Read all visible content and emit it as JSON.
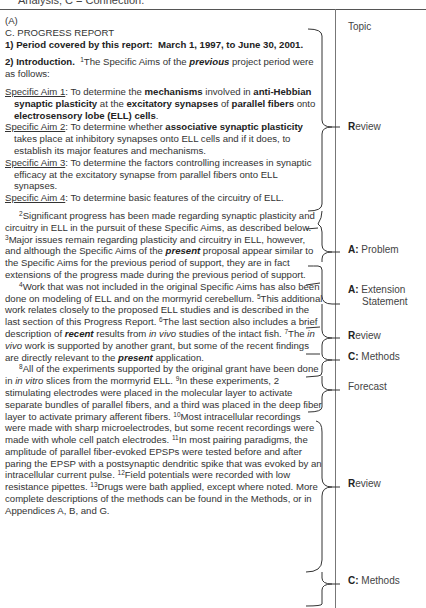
{
  "top_cut_text": "Analysis; C = Connection.",
  "document": {
    "label": "(A)",
    "section_title": "C. PROGRESS REPORT",
    "period": {
      "prefix": "1) Period covered by this report:",
      "value": "March 1, 1997, to June 30, 2001."
    },
    "intro": {
      "heading": "2) Introduction.",
      "s1_num": "1",
      "s1_a": "The Specific Aims of the ",
      "s1_em": "previous",
      "s1_b": " project period were as follows:"
    },
    "aims": [
      {
        "label": "Specific Aim 1",
        "parts": [
          {
            "t": ":  To determine the ",
            "s": ""
          },
          {
            "t": "mechanisms",
            "s": "b"
          },
          {
            "t": " involved in ",
            "s": ""
          },
          {
            "t": "anti-Hebbian synaptic plasticity",
            "s": "b"
          },
          {
            "t": " at the ",
            "s": ""
          },
          {
            "t": "excitatory synapses",
            "s": "b"
          },
          {
            "t": " of ",
            "s": ""
          },
          {
            "t": "parallel fibers",
            "s": "b"
          },
          {
            "t": " onto ",
            "s": ""
          },
          {
            "t": "electrosensory lobe (ELL) cells",
            "s": "b"
          },
          {
            "t": ".",
            "s": ""
          }
        ]
      },
      {
        "label": "Specific Aim 2",
        "parts": [
          {
            "t": ":  To determine whether ",
            "s": ""
          },
          {
            "t": "associative synaptic plasticity",
            "s": "b"
          },
          {
            "t": " takes place at inhibitory synapses onto ELL cells and if it does, to establish its major features and mechanisms.",
            "s": ""
          }
        ]
      },
      {
        "label": "Specific Aim 3",
        "parts": [
          {
            "t": ":  To determine the factors controlling increases in synaptic efficacy at the excitatory synapse from parallel fibers onto ELL synapses.",
            "s": ""
          }
        ]
      },
      {
        "label": "Specific Aim 4",
        "parts": [
          {
            "t": ":  To determine basic features of the circuitry of ELL.",
            "s": ""
          }
        ]
      }
    ],
    "paragraphs": [
      [
        {
          "t": "2",
          "s": "sup"
        },
        {
          "t": "Significant progress has been made regarding synaptic plasticity and circuitry in ELL in the pursuit of these Specific Aims, as described below.  ",
          "s": ""
        },
        {
          "t": "3",
          "s": "sup"
        },
        {
          "t": "Major issues remain regarding plasticity and circuitry in ELL, however, and although the Specific Aims of the ",
          "s": ""
        },
        {
          "t": "present",
          "s": "bi"
        },
        {
          "t": " proposal appear similar to the Specific Aims for the previous period of support, they are in fact extensions of the progress made during the previous period of support.",
          "s": ""
        }
      ],
      [
        {
          "t": "4",
          "s": "sup"
        },
        {
          "t": "Work that was not included in the original Specific Aims has also been done on modeling of ELL and on the mormyrid cerebellum.  ",
          "s": ""
        },
        {
          "t": "5",
          "s": "sup"
        },
        {
          "t": "This additional work relates closely to the proposed ELL studies and is described in the last section of this Progress Report.  ",
          "s": ""
        },
        {
          "t": "6",
          "s": "sup"
        },
        {
          "t": "The last section also includes a brief description of ",
          "s": ""
        },
        {
          "t": "recent",
          "s": "bi"
        },
        {
          "t": " results from ",
          "s": ""
        },
        {
          "t": "in vivo",
          "s": "i"
        },
        {
          "t": " studies of the intact fish. ",
          "s": ""
        },
        {
          "t": "7",
          "s": "sup"
        },
        {
          "t": "The ",
          "s": ""
        },
        {
          "t": "in vivo",
          "s": "i"
        },
        {
          "t": " work is supported by another grant, but some of the recent findings are directly relevant to the ",
          "s": ""
        },
        {
          "t": "present",
          "s": "bi"
        },
        {
          "t": " application.",
          "s": ""
        }
      ],
      [
        {
          "t": "8",
          "s": "sup"
        },
        {
          "t": "All of the experiments supported by the original grant have been done in ",
          "s": ""
        },
        {
          "t": "in vitro",
          "s": "i"
        },
        {
          "t": " slices from the mormyrid ELL.  ",
          "s": ""
        },
        {
          "t": "9",
          "s": "sup"
        },
        {
          "t": "In these experiments, 2 stimulating electrodes were placed in the molecular layer to activate separate bundles of parallel fibers, and a third was placed in the deep fiber layer to activate primary afferent fibers.  ",
          "s": ""
        },
        {
          "t": "10",
          "s": "sup"
        },
        {
          "t": "Most intracellular recordings were made with sharp microelectrodes, but some recent recordings were made with whole cell patch electrodes.  ",
          "s": ""
        },
        {
          "t": "11",
          "s": "sup"
        },
        {
          "t": "In most pairing paradigms, the amplitude of parallel fiber-evoked EPSPs were tested before and after paring the EPSP with a postsynaptic dendritic spike that was evoked by an intracellular current pulse.  ",
          "s": ""
        },
        {
          "t": "12",
          "s": "sup"
        },
        {
          "t": "Field potentials were recorded with low resistance pipettes.  ",
          "s": ""
        },
        {
          "t": "13",
          "s": "sup"
        },
        {
          "t": "Drugs were bath applied, except where noted.  More complete descriptions of the methods can be found in the Methods, or in Appendices A, B, and G.",
          "s": ""
        }
      ]
    ]
  },
  "annotations": [
    {
      "key": "",
      "text": "Topic",
      "top": 27
    },
    {
      "key": "R",
      "text": "eview",
      "top": 127
    },
    {
      "key": "A:",
      "text": " Problem",
      "top": 250
    },
    {
      "key": "A:",
      "text": " Extension",
      "top": 290,
      "line2": "Statement"
    },
    {
      "key": "R",
      "text": "eview",
      "top": 336
    },
    {
      "key": "C:",
      "text": " Methods",
      "top": 357
    },
    {
      "key": "",
      "text": "Forecast",
      "top": 387
    },
    {
      "key": "R",
      "text": "eview",
      "top": 484
    },
    {
      "key": "C:",
      "text": " Methods",
      "top": 581
    }
  ]
}
